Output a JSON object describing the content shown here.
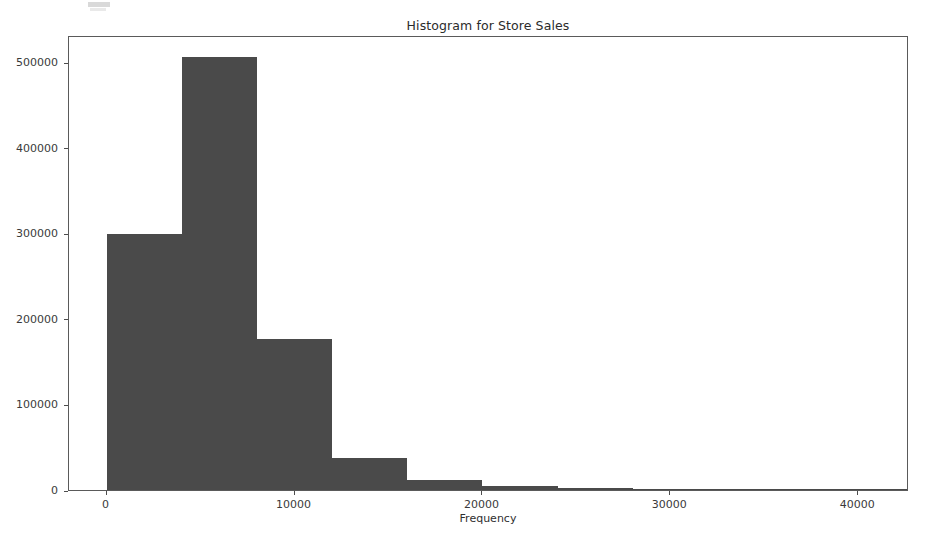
{
  "chart_data": {
    "type": "bar",
    "title": "Histogram for Store Sales",
    "xlabel": "Frequency",
    "ylabel": "",
    "xlim": [
      -2000,
      42700
    ],
    "ylim": [
      0,
      532000
    ],
    "grid": false,
    "legend": null,
    "bar_color": "#4a4a4a",
    "bin_width": 4000,
    "xticks": [
      0,
      10000,
      20000,
      30000,
      40000
    ],
    "xtick_labels": [
      "0",
      "10000",
      "20000",
      "30000",
      "40000"
    ],
    "yticks": [
      0,
      100000,
      200000,
      300000,
      400000,
      500000
    ],
    "ytick_labels": [
      "0",
      "100000",
      "200000",
      "300000",
      "400000",
      "500000"
    ],
    "bins": [
      {
        "label": "0-4000",
        "x0": 0,
        "x1": 4000,
        "value": 299000
      },
      {
        "label": "4000-8000",
        "x0": 4000,
        "x1": 8000,
        "value": 506000
      },
      {
        "label": "8000-12000",
        "x0": 8000,
        "x1": 12000,
        "value": 176000
      },
      {
        "label": "12000-16000",
        "x0": 12000,
        "x1": 16000,
        "value": 37000
      },
      {
        "label": "16000-20000",
        "x0": 16000,
        "x1": 20000,
        "value": 12000
      },
      {
        "label": "20000-24000",
        "x0": 20000,
        "x1": 24000,
        "value": 5000
      },
      {
        "label": "24000-28000",
        "x0": 24000,
        "x1": 28000,
        "value": 1800
      },
      {
        "label": "28000-32000",
        "x0": 28000,
        "x1": 32000,
        "value": 900
      },
      {
        "label": "32000-36000",
        "x0": 32000,
        "x1": 36000,
        "value": 500
      },
      {
        "label": "36000-40000",
        "x0": 36000,
        "x1": 40000,
        "value": 300
      },
      {
        "label": "40000-44000",
        "x0": 40000,
        "x1": 44000,
        "value": 200
      }
    ]
  }
}
